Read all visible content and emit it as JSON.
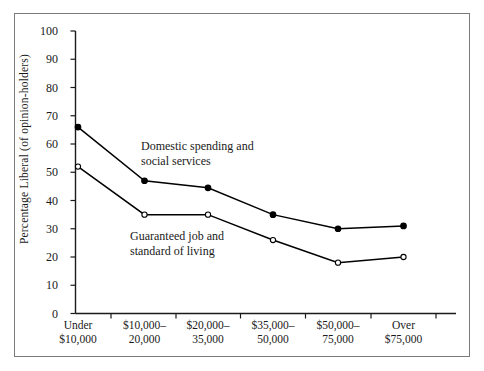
{
  "chart_data": {
    "type": "line",
    "title": "",
    "xlabel": "",
    "ylabel": "Percentage Liberal (of opinion-holders)",
    "ylim": [
      0,
      100
    ],
    "yticks": [
      100,
      90,
      80,
      70,
      60,
      50,
      40,
      30,
      20,
      10,
      0
    ],
    "grid": false,
    "legend": "inline-annotations",
    "categories": [
      "Under\n$10,000",
      "$10,000–\n20,000",
      "$20,000–\n35,000",
      "$35,000–\n50,000",
      "$50,000–\n75,000",
      "Over\n$75,000"
    ],
    "category_lines": [
      [
        "Under",
        "$10,000"
      ],
      [
        "$10,000–",
        "20,000"
      ],
      [
        "$20,000–",
        "35,000"
      ],
      [
        "$35,000–",
        "50,000"
      ],
      [
        "$50,000–",
        "75,000"
      ],
      [
        "Over",
        "$75,000"
      ]
    ],
    "series": [
      {
        "name": "Domestic spending and social services",
        "marker": "filled-circle",
        "color": "#000000",
        "values": [
          66,
          47,
          44.5,
          35,
          30,
          31
        ]
      },
      {
        "name": "Guaranteed job and standard of living",
        "marker": "open-circle",
        "color": "#000000",
        "values": [
          52,
          35,
          35,
          26,
          18,
          20
        ]
      }
    ],
    "annotations": [
      {
        "id": "domestic-spending-label",
        "lines": [
          "Domestic spending and",
          "social services"
        ],
        "x": 141,
        "y": 139
      },
      {
        "id": "guaranteed-job-label",
        "lines": [
          "Guaranteed job and",
          "standard of living"
        ],
        "x": 130,
        "y": 229
      }
    ]
  },
  "axes": {
    "y_title": "Percentage Liberal (of opinion-holders)"
  }
}
